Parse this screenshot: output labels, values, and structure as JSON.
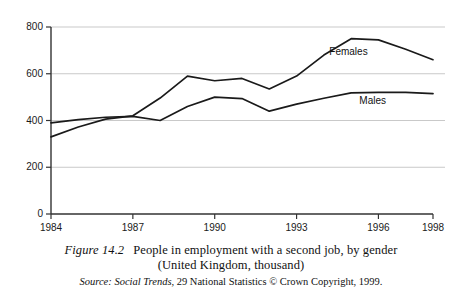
{
  "caption": {
    "figure_number": "Figure 14.2",
    "title": "People in employment with a second job, by gender",
    "subtitle": "(United Kingdom, thousand)",
    "source_prefix": "Source:",
    "source_publication": "Social Trends,",
    "source_rest": "29 National Statistics © Crown Copyright, 1999."
  },
  "chart_data": {
    "type": "line",
    "title": "People in employment with a second job, by gender",
    "subtitle": "(United Kingdom, thousand)",
    "xlabel": "",
    "ylabel": "",
    "units": "thousand",
    "grid": true,
    "legend_position": "inline-labels",
    "xlim": [
      1984,
      1998
    ],
    "ylim": [
      0,
      800
    ],
    "yticks": [
      0,
      200,
      400,
      600,
      800
    ],
    "ytick_labels": [
      "0",
      "200",
      "400",
      "600",
      "800"
    ],
    "xticks": [
      1984,
      1987,
      1990,
      1993,
      1996,
      1998
    ],
    "xtick_labels": [
      "1984",
      "1987",
      "1990",
      "1993",
      "1996",
      "1998"
    ],
    "x": [
      1984,
      1985,
      1986,
      1987,
      1988,
      1989,
      1990,
      1991,
      1992,
      1993,
      1994,
      1995,
      1996,
      1997,
      1998
    ],
    "series": [
      {
        "name": "Females",
        "color": "#1a1a1a",
        "values": [
          330,
          372,
          406,
          420,
          496,
          590,
          570,
          580,
          535,
          590,
          680,
          750,
          745,
          705,
          660
        ]
      },
      {
        "name": "Males",
        "color": "#1a1a1a",
        "values": [
          390,
          404,
          414,
          418,
          400,
          460,
          500,
          494,
          440,
          470,
          495,
          518,
          520,
          520,
          515
        ]
      }
    ],
    "annotations": [
      {
        "text": "Females",
        "x": 1994.2,
        "y": 690
      },
      {
        "text": "Males",
        "x": 1995.3,
        "y": 478
      }
    ],
    "colors": {
      "line": "#1a1a1a",
      "grid": "#c9c9c9",
      "axis": "#333333",
      "background": "#ffffff"
    }
  }
}
